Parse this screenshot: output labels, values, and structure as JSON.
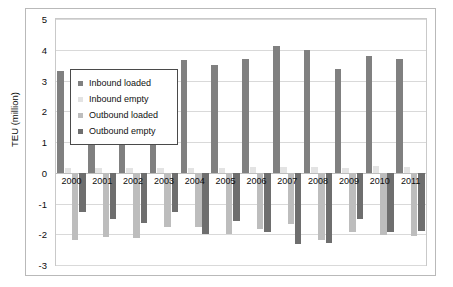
{
  "chart_data": {
    "type": "bar",
    "title": "",
    "xlabel": "",
    "ylabel": "TEU (million)",
    "ylim": [
      -3,
      5
    ],
    "ytick_labels": [
      "5",
      "4",
      "3",
      "2",
      "1",
      "0",
      "-1",
      "-2",
      "-3"
    ],
    "yticks": [
      5,
      4,
      3,
      2,
      1,
      0,
      -1,
      -2,
      -3
    ],
    "grid": true,
    "legend_position": "inside-upper-left",
    "categories": [
      "2000",
      "2001",
      "2002",
      "2003",
      "2004",
      "2005",
      "2006",
      "2007",
      "2008",
      "2009",
      "2010",
      "2011"
    ],
    "series": [
      {
        "name": "Inbound loaded",
        "color": "#808080",
        "values": [
          3.3,
          3.24,
          3.33,
          3.34,
          3.68,
          3.5,
          3.7,
          4.12,
          4.0,
          3.36,
          3.8,
          3.7
        ]
      },
      {
        "name": "Inbound empty",
        "color": "#e3e3e3",
        "values": [
          0.14,
          0.14,
          0.15,
          0.15,
          0.17,
          0.17,
          0.18,
          0.2,
          0.2,
          0.16,
          0.22,
          0.2
        ]
      },
      {
        "name": "Outbound loaded",
        "color": "#bdbdbd",
        "values": [
          -2.18,
          -2.1,
          -2.12,
          -1.78,
          -1.78,
          -1.98,
          -1.84,
          -1.66,
          -2.2,
          -1.94,
          -2.02,
          -2.06
        ]
      },
      {
        "name": "Outbound empty",
        "color": "#6e6e6e",
        "values": [
          -1.28,
          -1.52,
          -1.62,
          -1.28,
          -1.98,
          -1.56,
          -1.92,
          -2.32,
          -2.28,
          -1.5,
          -1.92,
          -1.9
        ]
      }
    ]
  },
  "legend": {
    "items": [
      {
        "label": "Inbound loaded"
      },
      {
        "label": "Inbound empty"
      },
      {
        "label": "Outbound loaded"
      },
      {
        "label": "Outbound empty"
      }
    ]
  }
}
